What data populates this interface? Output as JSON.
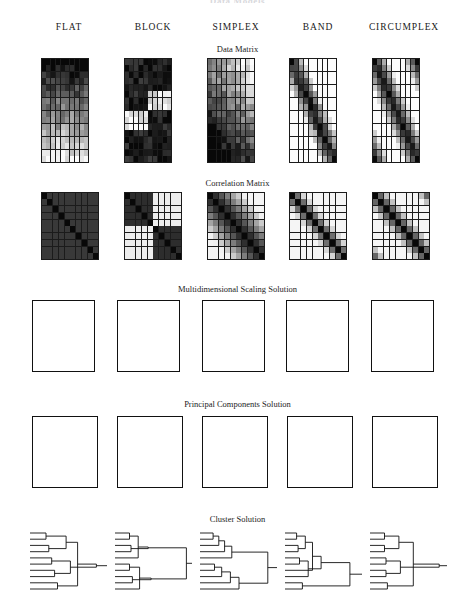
{
  "figure": {
    "cut_title": "Data Models",
    "columns": [
      "FLAT",
      "BLOCK",
      "SIMPLEX",
      "BAND",
      "CIRCUMPLEX"
    ],
    "row_titles": [
      "Data Matrix",
      "Correlation Matrix",
      "Multidimensional Scaling Solution",
      "Principal Components Solution",
      "Cluster Solution"
    ]
  },
  "chart_data": {
    "type": "heatmap",
    "title": "Data Models",
    "xlabel": "",
    "ylabel": "",
    "grid": true,
    "legend": "none",
    "columns": [
      "FLAT",
      "BLOCK",
      "SIMPLEX",
      "BAND",
      "CIRCUMPLEX"
    ],
    "rows": [
      "Data Matrix",
      "Correlation Matrix",
      "Multidimensional Scaling Solution",
      "Principal Components Solution",
      "Cluster Solution"
    ],
    "variables": [
      "A",
      "B",
      "C",
      "D",
      "E",
      "F",
      "G",
      "H",
      "I",
      "J"
    ],
    "data_matrix": {
      "type": "heatmap",
      "grid_cols": 10,
      "grid_rows": 16,
      "note": "Shaded cells, dark = high value, light = low value",
      "panels": {
        "FLAT": {
          "pattern": "row-gradient",
          "desc": "monotone darkness gradient from dark top rows to light bottom rows"
        },
        "BLOCK": {
          "pattern": "checker-blocks",
          "desc": "four quadrant blocks alternating dark / light"
        },
        "SIMPLEX": {
          "pattern": "staircase",
          "desc": "light upper-right, dark lower-left staircase"
        },
        "BAND": {
          "pattern": "diagonal-band",
          "desc": "dark band running down the main diagonal"
        },
        "CIRCUMPLEX": {
          "pattern": "wrapped-band",
          "desc": "diagonal band that wraps around corners"
        }
      }
    },
    "correlation_matrix": {
      "type": "heatmap",
      "grid_cols": 10,
      "grid_rows": 10,
      "note": "Symmetric 10x10, dark diagonal = r = 1.0",
      "panels": {
        "FLAT": {
          "pattern": "uniform-high",
          "desc": "uniformly dark, all correlations high"
        },
        "BLOCK": {
          "pattern": "two-blocks",
          "desc": "two dark blocks on the diagonal, light off-blocks"
        },
        "SIMPLEX": {
          "pattern": "simplex",
          "desc": "darkness decays with distance from diagonal"
        },
        "BAND": {
          "pattern": "band",
          "desc": "narrow dark band about the diagonal"
        },
        "CIRCUMPLEX": {
          "pattern": "circumplex",
          "desc": "band about diagonal plus dark corners (wrap-around)"
        }
      }
    },
    "mds_solution": {
      "type": "scatter",
      "xlim": [
        0,
        1
      ],
      "ylim": [
        0,
        1
      ],
      "panels": {
        "FLAT": [
          {
            "label": "D",
            "x": 0.22,
            "y": 0.16
          },
          {
            "label": "C",
            "x": 0.46,
            "y": 0.12
          },
          {
            "label": "H",
            "x": 0.83,
            "y": 0.12
          },
          {
            "label": "J",
            "x": 0.07,
            "y": 0.3
          },
          {
            "label": "A",
            "x": 0.31,
            "y": 0.31
          },
          {
            "label": "E",
            "x": 0.53,
            "y": 0.48
          },
          {
            "label": "B",
            "x": 0.17,
            "y": 0.66
          },
          {
            "label": "I",
            "x": 0.1,
            "y": 0.82
          },
          {
            "label": "G",
            "x": 0.41,
            "y": 0.88
          },
          {
            "label": "F",
            "x": 0.79,
            "y": 0.8
          }
        ],
        "BLOCK": [
          {
            "label": "E",
            "x": 0.36,
            "y": 0.21
          },
          {
            "label": "A",
            "x": 0.53,
            "y": 0.17
          },
          {
            "label": "B",
            "x": 0.58,
            "y": 0.24
          },
          {
            "label": "C",
            "x": 0.78,
            "y": 0.18
          },
          {
            "label": "G",
            "x": 0.14,
            "y": 0.38
          },
          {
            "label": "J",
            "x": 0.6,
            "y": 0.38
          },
          {
            "label": "D",
            "x": 0.7,
            "y": 0.34
          },
          {
            "label": "I",
            "x": 0.28,
            "y": 0.66
          },
          {
            "label": "F",
            "x": 0.56,
            "y": 0.68
          },
          {
            "label": "H",
            "x": 0.77,
            "y": 0.62
          }
        ],
        "SIMPLEX": [
          {
            "label": "A",
            "x": 0.1,
            "y": 0.5
          },
          {
            "label": "B",
            "x": 0.18,
            "y": 0.49
          },
          {
            "label": "C",
            "x": 0.27,
            "y": 0.47
          },
          {
            "label": "D",
            "x": 0.36,
            "y": 0.47
          },
          {
            "label": "E",
            "x": 0.45,
            "y": 0.47
          },
          {
            "label": "F",
            "x": 0.54,
            "y": 0.47
          },
          {
            "label": "G",
            "x": 0.63,
            "y": 0.47
          },
          {
            "label": "H",
            "x": 0.72,
            "y": 0.49
          },
          {
            "label": "I",
            "x": 0.83,
            "y": 0.49
          },
          {
            "label": "J",
            "x": 0.92,
            "y": 0.52
          }
        ],
        "BAND": [
          {
            "label": "A",
            "x": 0.08,
            "y": 0.49
          },
          {
            "label": "B",
            "x": 0.16,
            "y": 0.48
          },
          {
            "label": "C",
            "x": 0.26,
            "y": 0.46
          },
          {
            "label": "D",
            "x": 0.36,
            "y": 0.46
          },
          {
            "label": "E",
            "x": 0.45,
            "y": 0.46
          },
          {
            "label": "F",
            "x": 0.54,
            "y": 0.46
          },
          {
            "label": "G",
            "x": 0.63,
            "y": 0.46
          },
          {
            "label": "H",
            "x": 0.73,
            "y": 0.47
          },
          {
            "label": "I",
            "x": 0.85,
            "y": 0.5
          },
          {
            "label": "J",
            "x": 0.93,
            "y": 0.52
          }
        ],
        "CIRCUMPLEX": [
          {
            "label": "C",
            "x": 0.36,
            "y": 0.1
          },
          {
            "label": "D",
            "x": 0.6,
            "y": 0.09
          },
          {
            "label": "B",
            "x": 0.18,
            "y": 0.22
          },
          {
            "label": "E",
            "x": 0.84,
            "y": 0.17
          },
          {
            "label": "A",
            "x": 0.1,
            "y": 0.44
          },
          {
            "label": "F",
            "x": 0.92,
            "y": 0.42
          },
          {
            "label": "J",
            "x": 0.12,
            "y": 0.64
          },
          {
            "label": "G",
            "x": 0.88,
            "y": 0.64
          },
          {
            "label": "I",
            "x": 0.38,
            "y": 0.84
          },
          {
            "label": "H",
            "x": 0.68,
            "y": 0.84
          }
        ]
      }
    },
    "pca_solution": {
      "type": "scatter",
      "xlim": [
        0,
        1
      ],
      "ylim": [
        0,
        1
      ],
      "panels": {
        "FLAT": [
          {
            "label": "C",
            "x": 0.7,
            "y": 0.5
          },
          {
            "label": "F",
            "x": 0.76,
            "y": 0.5
          },
          {
            "label": "E",
            "x": 0.72,
            "y": 0.55
          },
          {
            "label": "D",
            "x": 0.76,
            "y": 0.56
          },
          {
            "label": "A",
            "x": 0.7,
            "y": 0.6
          },
          {
            "label": "B",
            "x": 0.74,
            "y": 0.6
          },
          {
            "label": "G",
            "x": 0.77,
            "y": 0.61
          },
          {
            "label": "H",
            "x": 0.73,
            "y": 0.64
          },
          {
            "label": "I",
            "x": 0.76,
            "y": 0.64
          },
          {
            "label": "J",
            "x": 0.74,
            "y": 0.58
          }
        ],
        "BLOCK": [
          {
            "label": "F",
            "x": 0.33,
            "y": 0.16
          },
          {
            "label": "G",
            "x": 0.39,
            "y": 0.15
          },
          {
            "label": "H",
            "x": 0.45,
            "y": 0.15
          },
          {
            "label": "I",
            "x": 0.22,
            "y": 0.22
          },
          {
            "label": "J",
            "x": 0.26,
            "y": 0.22
          },
          {
            "label": "A",
            "x": 0.8,
            "y": 0.58
          },
          {
            "label": "B",
            "x": 0.85,
            "y": 0.58
          },
          {
            "label": "C",
            "x": 0.9,
            "y": 0.58
          },
          {
            "label": "D",
            "x": 0.8,
            "y": 0.66
          },
          {
            "label": "E",
            "x": 0.87,
            "y": 0.66
          }
        ],
        "SIMPLEX": [
          {
            "label": "A",
            "x": 0.44,
            "y": 0.1
          },
          {
            "label": "B",
            "x": 0.52,
            "y": 0.15
          },
          {
            "label": "C",
            "x": 0.6,
            "y": 0.22
          },
          {
            "label": "D",
            "x": 0.68,
            "y": 0.3
          },
          {
            "label": "E",
            "x": 0.74,
            "y": 0.41
          },
          {
            "label": "F",
            "x": 0.78,
            "y": 0.52
          },
          {
            "label": "G",
            "x": 0.78,
            "y": 0.63
          },
          {
            "label": "H",
            "x": 0.74,
            "y": 0.74
          },
          {
            "label": "I",
            "x": 0.58,
            "y": 0.85
          },
          {
            "label": "J",
            "x": 0.45,
            "y": 0.88
          }
        ],
        "BAND": [
          {
            "label": "C",
            "x": 0.22,
            "y": 0.2
          },
          {
            "label": "D",
            "x": 0.34,
            "y": 0.12
          },
          {
            "label": "E",
            "x": 0.49,
            "y": 0.09
          },
          {
            "label": "F",
            "x": 0.62,
            "y": 0.11
          },
          {
            "label": "G",
            "x": 0.74,
            "y": 0.16
          },
          {
            "label": "H",
            "x": 0.84,
            "y": 0.24
          },
          {
            "label": "B",
            "x": 0.1,
            "y": 0.38
          },
          {
            "label": "I",
            "x": 0.92,
            "y": 0.4
          },
          {
            "label": "A",
            "x": 0.09,
            "y": 0.54
          },
          {
            "label": "J",
            "x": 0.92,
            "y": 0.56
          }
        ],
        "CIRCUMPLEX": [
          {
            "label": "C",
            "x": 0.3,
            "y": 0.14
          },
          {
            "label": "D",
            "x": 0.55,
            "y": 0.12
          },
          {
            "label": "E",
            "x": 0.82,
            "y": 0.18
          },
          {
            "label": "B",
            "x": 0.12,
            "y": 0.28
          },
          {
            "label": "F",
            "x": 0.9,
            "y": 0.44
          },
          {
            "label": "A",
            "x": 0.07,
            "y": 0.48
          },
          {
            "label": "G",
            "x": 0.86,
            "y": 0.64
          },
          {
            "label": "J",
            "x": 0.1,
            "y": 0.68
          },
          {
            "label": "H",
            "x": 0.6,
            "y": 0.86
          },
          {
            "label": "I",
            "x": 0.33,
            "y": 0.87
          }
        ]
      }
    },
    "cluster_solution": {
      "type": "dendrogram",
      "panels": {
        "FLAT": {
          "desc": "many near-equal length branches joining at similar heights, weak structure"
        },
        "BLOCK": {
          "desc": "two clearly separated clusters joining only at the far right"
        },
        "SIMPLEX": {
          "desc": "chained / ladder-like successive joins"
        },
        "BAND": {
          "desc": "chained joins with progressively increasing heights"
        },
        "CIRCUMPLEX": {
          "desc": "balanced pairs joining into two mid-level clusters"
        }
      }
    }
  }
}
